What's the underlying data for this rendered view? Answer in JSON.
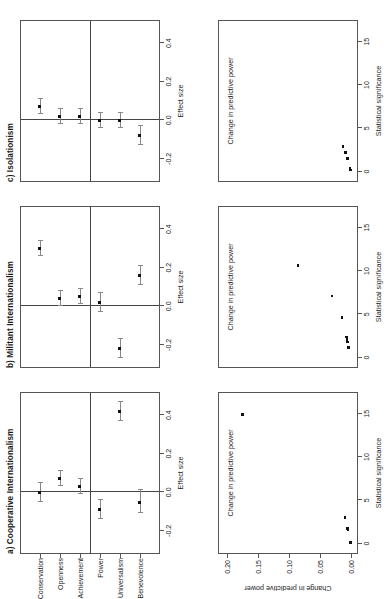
{
  "figure": {
    "orientation": "rotated-90-ccw",
    "panels_top_row_label": "coefficient plots with 95% confidence intervals",
    "panels_bottom_row_label": "scatter plots of change in predictive power vs statistical significance"
  },
  "panels": {
    "a": {
      "title": "a) Cooperative Internationalism",
      "coef_axis_title": "Effect size",
      "scatter_x_title": "Statistical significance",
      "scatter_y_title": "Change in predictive power"
    },
    "b": {
      "title": "b) Militant Internationalism",
      "coef_axis_title": "Effect size",
      "scatter_x_title": "Statistical significance",
      "scatter_y_title": "Change in predictive power"
    },
    "c": {
      "title": "c) Isolationism",
      "coef_axis_title": "Effect size",
      "scatter_x_title": "Statistical significance",
      "scatter_y_title": "Change in predictive power"
    }
  },
  "categories": [
    "Conservation",
    "Openness",
    "Achievement",
    "Power",
    "Universalism",
    "Benevolence"
  ],
  "effect_axis": {
    "ticks": [
      -0.2,
      0.0,
      0.2,
      0.4
    ],
    "tick_labels": [
      "-0.2",
      "0.0",
      "0.2",
      "0.4"
    ],
    "min": -0.32,
    "max": 0.52,
    "title": "Effect size"
  },
  "significance_axis": {
    "ticks": [
      0,
      5,
      10,
      15
    ],
    "tick_labels": [
      "0",
      "5",
      "10",
      "15"
    ],
    "min": -1.2,
    "max": 17.5,
    "title": "Statistical significance"
  },
  "predictive_axis": {
    "ticks": [
      0.0,
      0.05,
      0.1,
      0.15,
      0.2
    ],
    "tick_labels": [
      "0.00",
      "0.05",
      "0.10",
      "0.15",
      "0.20"
    ],
    "min": -0.012,
    "max": 0.215,
    "title": "Change in predictive power"
  },
  "chart_data": [
    {
      "type": "scatter",
      "id": "coef-a",
      "title": "a) Cooperative Internationalism",
      "xlabel": "Effect size",
      "ylabel": "",
      "xlim": [
        -0.32,
        0.52
      ],
      "categories": [
        "Conservation",
        "Openness",
        "Achievement",
        "Power",
        "Universalism",
        "Benevolence"
      ],
      "estimates": [
        0.0,
        0.07,
        0.03,
        -0.09,
        0.42,
        -0.05
      ],
      "ci_low": [
        -0.05,
        0.03,
        -0.01,
        -0.14,
        0.37,
        -0.11
      ],
      "ci_high": [
        0.05,
        0.11,
        0.07,
        -0.04,
        0.47,
        0.01
      ],
      "reference_line": 0.0,
      "grid": false
    },
    {
      "type": "scatter",
      "id": "coef-b",
      "title": "b) Militant Internationalism",
      "xlabel": "Effect size",
      "ylabel": "",
      "xlim": [
        -0.32,
        0.52
      ],
      "categories": [
        "Conservation",
        "Openness",
        "Achievement",
        "Power",
        "Universalism",
        "Benevolence"
      ],
      "estimates": [
        0.3,
        0.04,
        0.05,
        0.02,
        -0.22,
        0.16
      ],
      "ci_low": [
        0.26,
        0.0,
        0.01,
        -0.03,
        -0.27,
        0.11
      ],
      "ci_high": [
        0.34,
        0.08,
        0.09,
        0.07,
        -0.17,
        0.21
      ],
      "reference_line": 0.0,
      "grid": false
    },
    {
      "type": "scatter",
      "id": "coef-c",
      "title": "c) Isolationism",
      "xlabel": "Effect size",
      "ylabel": "",
      "xlim": [
        -0.32,
        0.52
      ],
      "categories": [
        "Conservation",
        "Openness",
        "Achievement",
        "Power",
        "Universalism",
        "Benevolence"
      ],
      "estimates": [
        0.07,
        0.02,
        0.02,
        0.0,
        0.0,
        -0.08
      ],
      "ci_low": [
        0.03,
        -0.02,
        -0.02,
        -0.04,
        -0.04,
        -0.13
      ],
      "ci_high": [
        0.11,
        0.06,
        0.06,
        0.04,
        0.04,
        -0.03
      ],
      "reference_line": 0.0,
      "grid": false
    },
    {
      "type": "scatter",
      "id": "scatter-a",
      "title": "a) Cooperative Internationalism",
      "xlabel": "Statistical significance",
      "ylabel": "Change in predictive power",
      "xlim": [
        -1.2,
        17.5
      ],
      "ylim": [
        -0.012,
        0.215
      ],
      "x": [
        0.1,
        1.6,
        1.7,
        1.8,
        3.0,
        14.9
      ],
      "y": [
        0.0,
        0.004,
        0.005,
        0.005,
        0.009,
        0.175
      ],
      "grid": false
    },
    {
      "type": "scatter",
      "id": "scatter-b",
      "title": "b) Militant Internationalism",
      "xlabel": "Statistical significance",
      "ylabel": "Change in predictive power",
      "xlim": [
        -1.2,
        17.5
      ],
      "ylim": [
        -0.012,
        0.215
      ],
      "x": [
        1.2,
        1.8,
        2.1,
        2.4,
        4.6,
        7.1,
        10.6
      ],
      "y": [
        0.003,
        0.005,
        0.006,
        0.007,
        0.014,
        0.03,
        0.085
      ],
      "grid": false
    },
    {
      "type": "scatter",
      "id": "scatter-c",
      "title": "c) Isolationism",
      "xlabel": "Statistical significance",
      "ylabel": "Change in predictive power",
      "xlim": [
        -1.2,
        17.5
      ],
      "ylim": [
        -0.012,
        0.215
      ],
      "x": [
        0.2,
        0.4,
        1.5,
        2.2,
        2.9
      ],
      "y": [
        0.0,
        0.001,
        0.005,
        0.008,
        0.012
      ],
      "grid": false
    }
  ]
}
